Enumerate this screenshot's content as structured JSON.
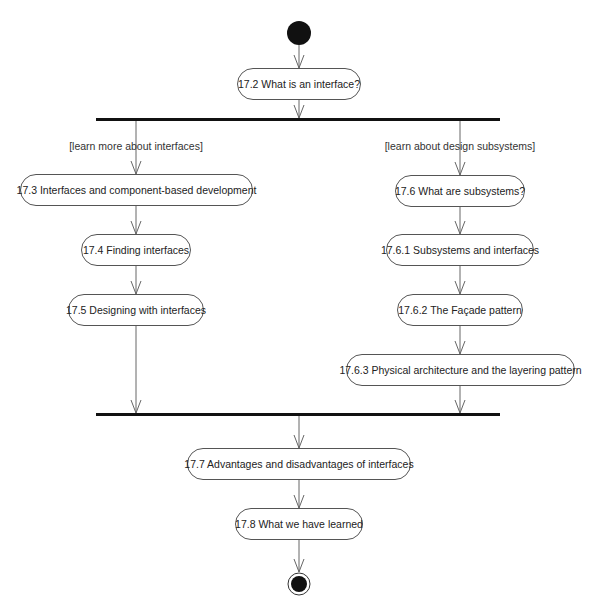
{
  "diagram": {
    "type": "UML activity diagram",
    "start": {
      "label": "initial-node"
    },
    "end": {
      "label": "final-node"
    },
    "nodes": {
      "n17_2": "17.2 What is an interface?",
      "n17_3": "17.3 Interfaces and component-based development",
      "n17_4": "17.4 Finding interfaces",
      "n17_5": "17.5 Designing with interfaces",
      "n17_6": "17.6 What are subsystems?",
      "n17_6_1": "17.6.1 Subsystems and interfaces",
      "n17_6_2": "17.6.2 The Façade pattern",
      "n17_6_3": "17.6.3 Physical architecture and the layering pattern",
      "n17_7": "17.7 Advantages and disadvantages of interfaces",
      "n17_8": "17.8 What we have learned"
    },
    "guards": {
      "left": "[learn more about interfaces]",
      "right": "[learn about design subsystems]"
    },
    "colors": {
      "line": "#666666",
      "bar": "#111111",
      "node_border": "#555555"
    }
  }
}
